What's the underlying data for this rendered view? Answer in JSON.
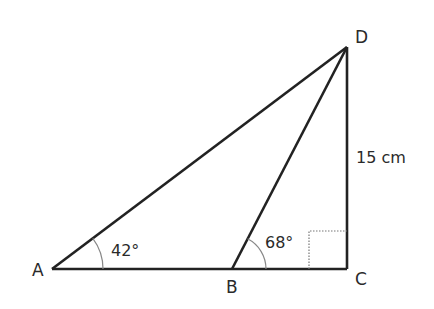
{
  "diagram": {
    "type": "triangle-geometry",
    "points": {
      "A": {
        "label": "A",
        "x": 52,
        "y": 269
      },
      "B": {
        "label": "B",
        "x": 232,
        "y": 269
      },
      "C": {
        "label": "C",
        "x": 347,
        "y": 269
      },
      "D": {
        "label": "D",
        "x": 347,
        "y": 47
      }
    },
    "segments": [
      {
        "from": "A",
        "to": "C"
      },
      {
        "from": "C",
        "to": "D"
      },
      {
        "from": "A",
        "to": "D"
      },
      {
        "from": "B",
        "to": "D"
      }
    ],
    "angles": {
      "A": {
        "label": "42°",
        "vertex": "A"
      },
      "B": {
        "label": "68°",
        "vertex": "B",
        "angle": "DBC"
      },
      "C": {
        "label": "right-angle",
        "vertex": "C"
      }
    },
    "lengths": {
      "CD": {
        "label": "15 cm",
        "segment": "CD"
      }
    },
    "colors": {
      "line": "#222222",
      "arc": "#888888",
      "text": "#2a2a2a"
    }
  }
}
